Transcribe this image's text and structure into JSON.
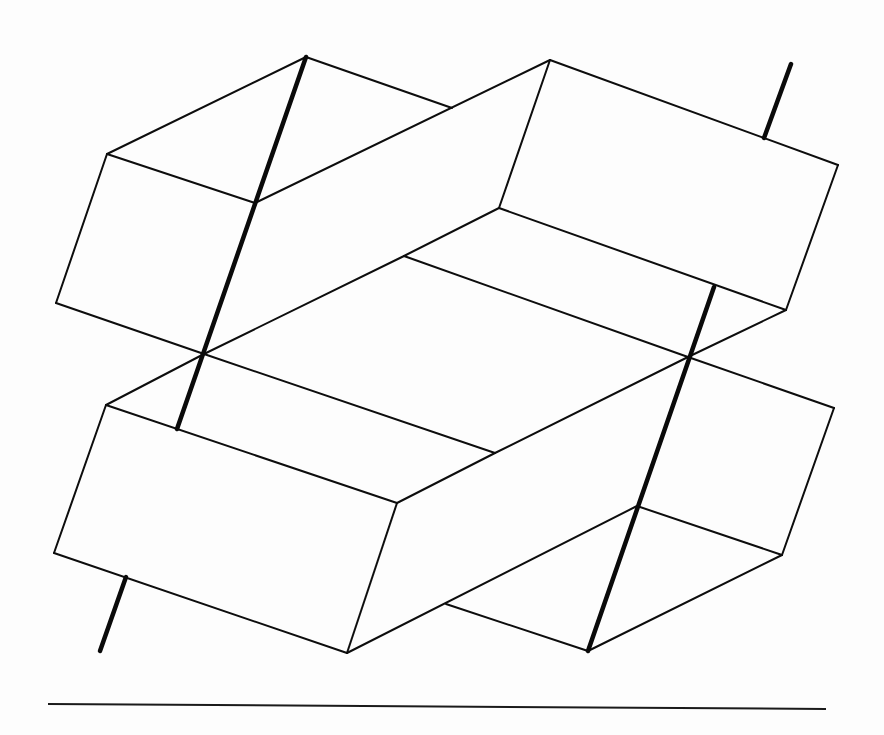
{
  "figure": {
    "description": "Line drawing of four interlocking rectangular prisms arranged around a central rhombus, pierced by two thick parallel rods, above a horizontal baseline",
    "colors": {
      "line": "#0d0d0d",
      "background": "#fdfdfd"
    },
    "vertices": {
      "A": [
        306,
        57
      ],
      "B": [
        107,
        154
      ],
      "C": [
        255,
        203
      ],
      "D": [
        56,
        303
      ],
      "P": [
        204,
        354
      ],
      "Q": [
        688,
        357
      ],
      "E": [
        550,
        60
      ],
      "F": [
        838,
        165
      ],
      "G": [
        499,
        208
      ],
      "H": [
        786,
        310
      ],
      "J": [
        452,
        108
      ],
      "K": [
        404,
        256
      ],
      "L": [
        495,
        453
      ],
      "M": [
        106,
        405
      ],
      "N": [
        397,
        503
      ],
      "O": [
        54,
        553
      ],
      "R": [
        347,
        653
      ],
      "S": [
        834,
        408
      ],
      "T": [
        637,
        506
      ],
      "U": [
        782,
        555
      ],
      "V": [
        588,
        651
      ],
      "W": [
        446,
        604
      ]
    },
    "edges": [
      [
        "A",
        "B"
      ],
      [
        "B",
        "D"
      ],
      [
        "B",
        "C"
      ],
      [
        "A",
        "J"
      ],
      [
        "D",
        "P"
      ],
      [
        "C",
        "E"
      ],
      [
        "E",
        "F"
      ],
      [
        "E",
        "G"
      ],
      [
        "F",
        "H"
      ],
      [
        "G",
        "H"
      ],
      [
        "H",
        "Q"
      ],
      [
        "G",
        "K"
      ],
      [
        "P",
        "K"
      ],
      [
        "K",
        "Q"
      ],
      [
        "P",
        "L"
      ],
      [
        "L",
        "Q"
      ],
      [
        "P",
        "M"
      ],
      [
        "M",
        "O"
      ],
      [
        "M",
        "N"
      ],
      [
        "O",
        "R"
      ],
      [
        "N",
        "R"
      ],
      [
        "N",
        "L"
      ],
      [
        "R",
        "T"
      ],
      [
        "Q",
        "S"
      ],
      [
        "S",
        "U"
      ],
      [
        "T",
        "U"
      ],
      [
        "U",
        "V"
      ],
      [
        "W",
        "V"
      ]
    ],
    "rods": [
      {
        "name": "left-rod",
        "from": [
          306,
          57
        ],
        "to": [
          100,
          651
        ],
        "segments": [
          [
            [
              306,
              57
            ],
            [
              177,
              429
            ]
          ],
          [
            [
              126,
              577
            ],
            [
              100,
              651
            ]
          ]
        ]
      },
      {
        "name": "right-rod",
        "from": [
          791,
          64
        ],
        "to": [
          588,
          651
        ],
        "segments": [
          [
            [
              791,
              64
            ],
            [
              764,
              138
            ]
          ],
          [
            [
              714,
              287
            ],
            [
              588,
              651
            ]
          ]
        ]
      }
    ],
    "baseline": {
      "from": [
        48,
        704
      ],
      "to": [
        826,
        709
      ]
    }
  }
}
